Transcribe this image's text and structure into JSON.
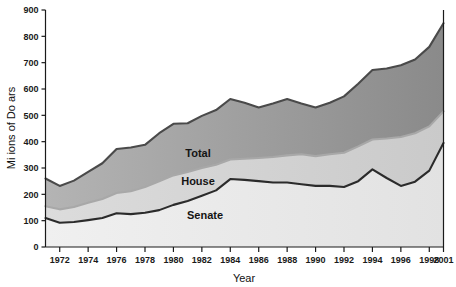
{
  "chart_data": {
    "type": "area",
    "title": "",
    "xlabel": "Year",
    "ylabel": "Mi  ions of Do  ars",
    "stacked": true,
    "grid": false,
    "legend_position": "inline",
    "x": [
      1971,
      1972,
      1973,
      1974,
      1975,
      1976,
      1977,
      1978,
      1979,
      1980,
      1981,
      1982,
      1983,
      1984,
      1985,
      1986,
      1987,
      1988,
      1989,
      1990,
      1991,
      1992,
      1993,
      1994,
      1995,
      1996,
      1997,
      1998,
      2001
    ],
    "xtick_labels": [
      "1972",
      "1974",
      "1976",
      "1978",
      "1980",
      "1982",
      "1984",
      "1986",
      "1988",
      "1990",
      "1992",
      "1994",
      "1996",
      "1998",
      "2001"
    ],
    "xtick_values": [
      1972,
      1974,
      1976,
      1978,
      1980,
      1982,
      1984,
      1986,
      1988,
      1990,
      1992,
      1994,
      1996,
      1998,
      2001
    ],
    "ytick_labels": [
      "0",
      "100",
      "200",
      "300",
      "400",
      "500",
      "600",
      "700",
      "800",
      "900"
    ],
    "ytick_values": [
      0,
      100,
      200,
      300,
      400,
      500,
      600,
      700,
      800,
      900
    ],
    "ylim": [
      0,
      900
    ],
    "xlim": [
      1971,
      2001
    ],
    "series": [
      {
        "name": "Senate",
        "label": "Senate",
        "color": "#2b2b2b",
        "fill": "#ebebeb",
        "values": [
          110,
          92,
          95,
          102,
          110,
          128,
          125,
          130,
          140,
          160,
          175,
          195,
          215,
          258,
          255,
          250,
          245,
          245,
          238,
          232,
          232,
          228,
          250,
          295,
          262,
          232,
          248,
          290,
          395
        ]
      },
      {
        "name": "House",
        "label": "House",
        "color": "#a8a8a8",
        "fill": "#d2d2d2",
        "values": [
          155,
          143,
          152,
          168,
          182,
          205,
          212,
          228,
          250,
          272,
          285,
          300,
          312,
          332,
          335,
          338,
          342,
          348,
          352,
          345,
          352,
          358,
          382,
          408,
          412,
          418,
          432,
          458,
          515
        ]
      },
      {
        "name": "Total",
        "label": "Total",
        "color": "#4a4a4a",
        "fill": "#9a9a9a",
        "values": [
          260,
          232,
          252,
          285,
          318,
          372,
          378,
          388,
          432,
          468,
          470,
          498,
          520,
          562,
          548,
          530,
          545,
          562,
          545,
          530,
          548,
          572,
          620,
          672,
          678,
          690,
          712,
          760,
          850
        ]
      }
    ],
    "annotations": [
      {
        "text": "Total",
        "x_px": 198,
        "y_px": 157
      },
      {
        "text": "House",
        "x_px": 198,
        "y_px": 185
      },
      {
        "text": "Senate",
        "x_px": 205,
        "y_px": 219
      }
    ],
    "axis_color": "#1a1a1a"
  }
}
